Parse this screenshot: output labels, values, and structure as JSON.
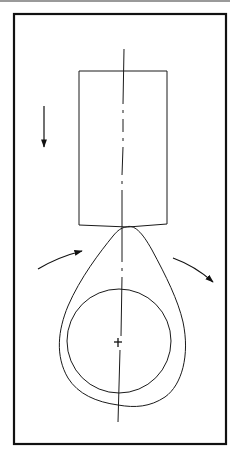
{
  "diagram": {
    "title": "",
    "type": "mechanical schematic",
    "colors": {
      "stroke": "#1a1a1a",
      "frame": "#111111",
      "top_rule": "#9a9a9a",
      "background": "#ffffff"
    },
    "elements": {
      "frame": {
        "label": "outer-frame"
      },
      "roller": {
        "label": "roller-block"
      },
      "centerline": {
        "label": "vertical-centerline",
        "style": "dash-dot"
      },
      "cam": {
        "label": "teardrop-cam"
      },
      "shaft": {
        "label": "inner-circle-shaft"
      },
      "center_mark": {
        "label": "center-cross"
      },
      "arrow_down": {
        "label": "downward-motion-arrow"
      },
      "arrow_left": {
        "label": "incoming-rotation-arrow"
      },
      "arrow_right": {
        "label": "outgoing-rotation-arrow"
      }
    }
  }
}
